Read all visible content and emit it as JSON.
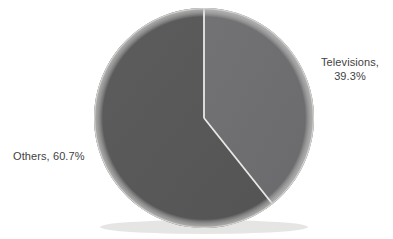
{
  "chart_data": {
    "type": "pie",
    "title": "",
    "subtitle": "",
    "xlabel": "",
    "ylabel": "",
    "legend_position": "none",
    "grid": false,
    "labels_inline": true,
    "categories": [
      "Televisions",
      "Others"
    ],
    "values": [
      39.3,
      60.7
    ],
    "units": "%",
    "total": 100.0,
    "start_angle_deg": 0,
    "direction": "clockwise",
    "slices": [
      {
        "name": "Televisions",
        "value": 39.3,
        "value_text": "39.3%",
        "label_text": "Televisions,",
        "sweep_deg": 141.5,
        "color": "#6e6e70"
      },
      {
        "name": "Others",
        "value": 60.7,
        "value_text": "60.7%",
        "label_text": "Others,",
        "sweep_deg": 218.5,
        "color": "#585858"
      }
    ]
  },
  "labels": {
    "televisions": {
      "line1": "Televisions,",
      "line2": "39.3%"
    },
    "others": {
      "line1": "Others, 60.7%"
    }
  },
  "colors": {
    "background": "#ffffff",
    "slice_televisions": "#6e6e70",
    "slice_others": "#585858",
    "divider": "#e8e8e6",
    "rim": "#d9d9d7",
    "text": "#3f3f3f"
  },
  "geometry": {
    "center_x": 204,
    "center_y": 118,
    "radius": 110
  }
}
